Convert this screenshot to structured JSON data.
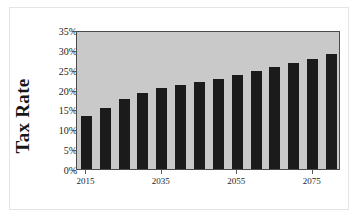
{
  "chart_data": {
    "type": "bar",
    "title": "",
    "xlabel": "",
    "ylabel": "Tax Rate",
    "ylim": [
      0,
      0.35
    ],
    "grid": false,
    "legend": null,
    "y_tick_labels": [
      "0%",
      "5%",
      "10%",
      "15%",
      "20%",
      "25%",
      "30%",
      "35%"
    ],
    "y_tick_values": [
      0,
      5,
      10,
      15,
      20,
      25,
      30,
      35
    ],
    "x_tick_labels": [
      "2015",
      "2035",
      "2055",
      "2075"
    ],
    "x_tick_categories": [
      "2015",
      "2035",
      "2055",
      "2075"
    ],
    "categories": [
      "2015",
      "2020",
      "2025",
      "2030",
      "2035",
      "2040",
      "2045",
      "2050",
      "2055",
      "2060",
      "2065",
      "2070",
      "2075",
      "2080"
    ],
    "values": [
      13.6,
      15.6,
      17.8,
      19.5,
      20.7,
      21.5,
      22.3,
      23.1,
      24.1,
      25.1,
      26.0,
      27.1,
      28.1,
      29.3
    ],
    "value_labels": [
      "13.6%",
      "15.6%",
      "17.8%",
      "19.5%",
      "20.7%",
      "21.5%",
      "22.3%",
      "23.1%",
      "24.1%",
      "25.1%",
      "26.0%",
      "27.1%",
      "28.1%",
      "29.3%"
    ],
    "colors": {
      "bar": "#1b1b1b",
      "plot_background": "#c9c9c9",
      "plot_border": "#4a4a4a",
      "figure_background": "#ffffff",
      "outer_frame": "#e4e4e4",
      "text": "#1d1d1d"
    }
  },
  "axis": {
    "y_title": "Tax Rate"
  }
}
